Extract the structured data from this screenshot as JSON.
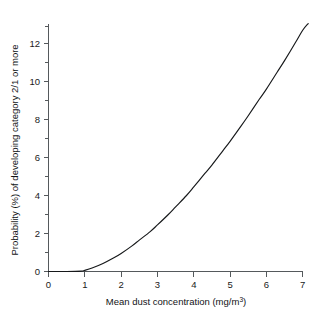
{
  "chart_data": {
    "type": "line",
    "title": "",
    "subtitle": "",
    "xlabel": "Mean dust concentration (mg/m",
    "xlabel_sup": "3",
    "xlabel_tail": ")",
    "xlabel_full": "Mean dust concentration (mg/m3)",
    "ylabel": "Probability (%) of developing category 2/1 or more",
    "xlim": [
      0,
      7.2
    ],
    "ylim": [
      0,
      13.2
    ],
    "grid": false,
    "legend": null,
    "xticks": [
      0,
      1,
      2,
      3,
      4,
      5,
      6,
      7
    ],
    "xtick_labels": [
      "0",
      "1",
      "2",
      "3",
      "4",
      "5",
      "6",
      "7"
    ],
    "yticks": [
      0,
      2,
      4,
      6,
      8,
      10,
      12
    ],
    "ytick_labels": [
      "0",
      "2",
      "4",
      "6",
      "8",
      "10",
      "12"
    ],
    "yticks_minor": [
      1,
      3,
      5,
      7,
      9,
      11,
      13
    ],
    "series": [
      {
        "name": "Probability of category 2/1 or more",
        "color": "#16181a",
        "x": [
          0.0,
          0.5,
          0.9,
          1.0,
          1.2,
          1.5,
          1.8,
          2.0,
          2.3,
          2.5,
          2.8,
          3.0,
          3.3,
          3.5,
          3.8,
          4.0,
          4.3,
          4.5,
          4.8,
          5.0,
          5.3,
          5.5,
          5.8,
          6.0,
          6.3,
          6.5,
          6.8,
          7.0,
          7.15
        ],
        "y": [
          0.0,
          0.0,
          0.02,
          0.06,
          0.18,
          0.42,
          0.72,
          0.95,
          1.35,
          1.65,
          2.1,
          2.45,
          3.0,
          3.4,
          4.0,
          4.45,
          5.15,
          5.6,
          6.35,
          6.85,
          7.65,
          8.2,
          9.05,
          9.6,
          10.5,
          11.1,
          12.05,
          12.7,
          13.05
        ]
      }
    ]
  },
  "figure": {
    "background_color": "#ffffff",
    "axis_color": "#55595c",
    "curve_color": "#16181a"
  }
}
